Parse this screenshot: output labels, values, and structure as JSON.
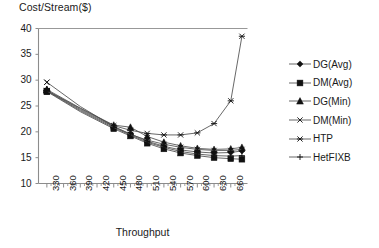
{
  "chart_data": {
    "type": "line",
    "title": "",
    "ylabel": "Cost/Stream($)",
    "xlabel": "Throughput",
    "ylim": [
      10,
      40
    ],
    "ytick_values": [
      10,
      15,
      20,
      25,
      30,
      35,
      40
    ],
    "ytick_labels": [
      "10",
      "15",
      "20",
      "25",
      "30",
      "35",
      "40"
    ],
    "xlim": [
      315,
      690
    ],
    "xtick_labels": [
      "330",
      "360",
      "390",
      "420",
      "450",
      "480",
      "510",
      "540",
      "570",
      "600",
      "630",
      "660"
    ],
    "xtick_values": [
      330,
      360,
      390,
      420,
      450,
      480,
      510,
      540,
      570,
      600,
      630,
      660
    ],
    "xtick_minor_step": 7.5,
    "grid": false,
    "legend_position": "right",
    "line_color": "#4d4d4d",
    "marker_color": "#111111",
    "x": [
      330,
      390,
      450,
      480,
      510,
      540,
      570,
      600,
      630,
      660,
      680
    ],
    "series": [
      {
        "name": "DG(Avg)",
        "marker": "filled-diamond",
        "values": [
          28.0,
          24.3,
          21.0,
          19.6,
          18.2,
          17.2,
          16.5,
          16.1,
          15.9,
          16.0,
          16.3
        ]
      },
      {
        "name": "DM(Avg)",
        "marker": "filled-square",
        "values": [
          27.8,
          23.9,
          20.6,
          19.2,
          17.8,
          16.7,
          15.9,
          15.4,
          15.0,
          14.8,
          14.7
        ]
      },
      {
        "name": "DG(Min)",
        "marker": "filled-triangle",
        "values": [
          28.2,
          24.6,
          21.3,
          20.9,
          19.1,
          18.0,
          17.3,
          16.8,
          16.6,
          16.7,
          17.0
        ]
      },
      {
        "name": "DM(Min)",
        "marker": "cross-x",
        "values": [
          29.6,
          24.9,
          21.0,
          19.5,
          18.4,
          17.6,
          17.0,
          16.6,
          16.4,
          16.4,
          16.6
        ]
      },
      {
        "name": "HTP",
        "marker": "asterisk",
        "values": [
          28.0,
          24.5,
          21.2,
          20.3,
          19.7,
          19.4,
          19.4,
          19.8,
          21.6,
          26.0,
          38.5
        ]
      },
      {
        "name": "HetFIXB",
        "marker": "plus",
        "values": [
          27.9,
          24.1,
          20.8,
          19.4,
          18.0,
          17.0,
          16.2,
          15.7,
          15.4,
          15.3,
          15.4
        ]
      }
    ]
  },
  "legend": {
    "entries": [
      {
        "label": "DG(Avg)"
      },
      {
        "label": "DM(Avg)"
      },
      {
        "label": "DG(Min)"
      },
      {
        "label": "DM(Min)"
      },
      {
        "label": "HTP"
      },
      {
        "label": "HetFIXB"
      }
    ]
  }
}
